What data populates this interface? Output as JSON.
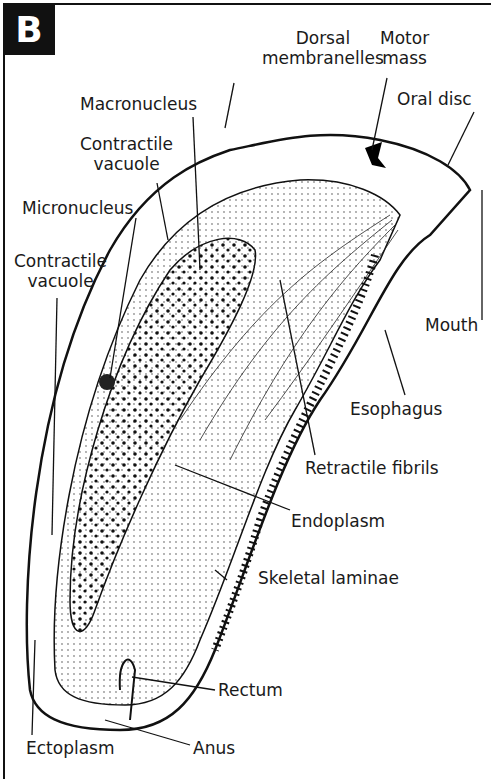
{
  "panel_label": "B",
  "labels": {
    "dorsal_membranelles": [
      "Dorsal",
      "membranelles"
    ],
    "motor_mass": [
      "Motor",
      "mass"
    ],
    "oral_disc": "Oral disc",
    "macronucleus": "Macronucleus",
    "contractile_vacuole_upper": [
      "Contractile",
      "vacuole"
    ],
    "micronucleus": "Micronucleus",
    "contractile_vacuole_lower": [
      "Contractile",
      "vacuole"
    ],
    "mouth": "Mouth",
    "esophagus": "Esophagus",
    "retractile_fibrils": "Retractile fibrils",
    "endoplasm": "Endoplasm",
    "skeletal_laminae": "Skeletal laminae",
    "rectum": "Rectum",
    "ectoplasm": "Ectoplasm",
    "anus": "Anus"
  },
  "colors": {
    "ink": "#111111",
    "background": "#ffffff"
  }
}
